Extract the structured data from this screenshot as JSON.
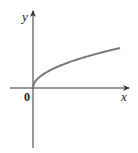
{
  "chart_data": {
    "type": "line",
    "title": "",
    "function": "y = sqrt(x)",
    "xlabel": "x",
    "ylabel": "y",
    "origin_label": "0",
    "x": [
      0,
      0.05,
      0.2,
      0.5,
      1,
      1.5,
      2,
      2.5,
      3
    ],
    "y": [
      0,
      0.224,
      0.447,
      0.707,
      1,
      1.225,
      1.414,
      1.581,
      1.732
    ],
    "curve_color": "#7a7a7a",
    "axis_color": "#333333",
    "grid": false,
    "legend": null
  },
  "labels": {
    "x_axis": "x",
    "y_axis": "y",
    "origin": "0"
  }
}
